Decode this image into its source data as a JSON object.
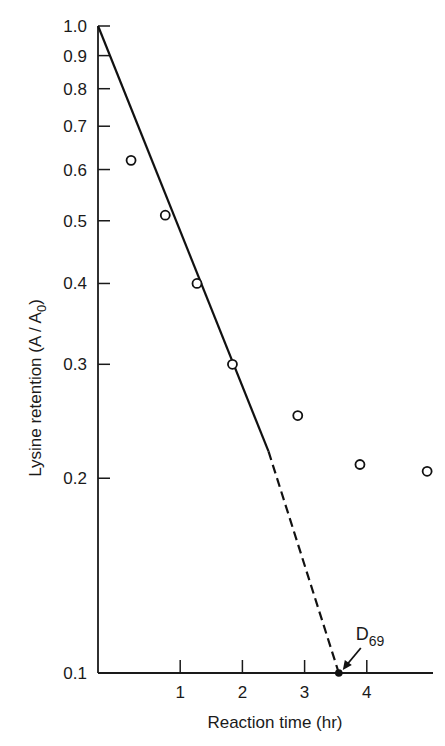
{
  "chart_data": {
    "type": "scatter",
    "title": "",
    "xlabel": "Reaction time (hr)",
    "ylabel": "Lysine retention (A / A",
    "ylabel_subscript": "0",
    "ylabel_suffix": ")",
    "yscale": "log",
    "ylim": [
      0.1,
      1.0
    ],
    "xlim": [
      -0.32,
      5.2
    ],
    "grid": false,
    "legend": null,
    "x_ticks": [
      1,
      2,
      3,
      4
    ],
    "x_tick_labels": [
      "1",
      "2",
      "3",
      "4"
    ],
    "y_ticks": [
      0.1,
      0.2,
      0.3,
      0.4,
      0.5,
      0.6,
      0.7,
      0.8,
      0.9,
      1.0
    ],
    "y_tick_labels": [
      "0.1",
      "0.2",
      "0.3",
      "0.4",
      "0.5",
      "0.6",
      "0.7",
      "0.8",
      "0.9",
      "1.0"
    ],
    "series": [
      {
        "name": "Observed lysine retention",
        "marker": "open-circle",
        "x": [
          0.21,
          0.76,
          1.27,
          1.84,
          2.89,
          3.89,
          4.97
        ],
        "y": [
          0.62,
          0.51,
          0.4,
          0.3,
          0.25,
          0.21,
          0.205
        ]
      },
      {
        "name": "First-order fit",
        "style": "line",
        "x": [
          -0.32,
          2.42
        ],
        "y": [
          1.0,
          0.22
        ]
      },
      {
        "name": "Extrapolation",
        "style": "dashed",
        "x": [
          2.42,
          3.55
        ],
        "y": [
          0.22,
          0.1
        ]
      }
    ],
    "annotations": [
      {
        "text": "D",
        "subscript": "69",
        "x": 3.55,
        "y": 0.1,
        "arrow": true,
        "marker": "filled-dot"
      }
    ]
  }
}
